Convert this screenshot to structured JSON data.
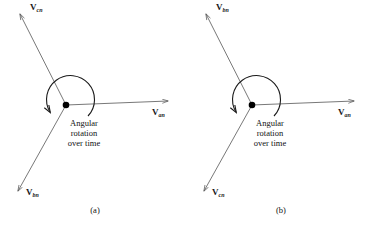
{
  "figure": {
    "type": "phasor-diagram-pair",
    "background_color": "#ffffff",
    "line_color": "#555555",
    "text_color": "#111111",
    "origin_dot_color": "#000000"
  },
  "panels": [
    {
      "id": "a",
      "caption": "(a)",
      "origin": {
        "x": 66,
        "y": 105
      },
      "rotation_note": {
        "line1": "Angular",
        "line2": "rotation",
        "line3": "over time",
        "direction": "counterclockwise"
      },
      "vectors": [
        {
          "name": "vcn",
          "symbol": "V",
          "subscript": "cn",
          "angle_deg": 125,
          "tip": {
            "x": 18,
            "y": 12
          },
          "label_pos": {
            "x": 30,
            "y": 5
          }
        },
        {
          "name": "van",
          "symbol": "V",
          "subscript": "an",
          "angle_deg": 0,
          "tip": {
            "x": 172,
            "y": 101
          },
          "label_pos": {
            "x": 152,
            "y": 110
          }
        },
        {
          "name": "vbn",
          "symbol": "V",
          "subscript": "bn",
          "angle_deg": 235,
          "tip": {
            "x": 14,
            "y": 196
          },
          "label_pos": {
            "x": 26,
            "y": 190
          }
        }
      ]
    },
    {
      "id": "b",
      "caption": "(b)",
      "origin": {
        "x": 66,
        "y": 105
      },
      "rotation_note": {
        "line1": "Angular",
        "line2": "rotation",
        "line3": "over time",
        "direction": "counterclockwise"
      },
      "vectors": [
        {
          "name": "vbn",
          "symbol": "V",
          "subscript": "bn",
          "angle_deg": 125,
          "tip": {
            "x": 18,
            "y": 12
          },
          "label_pos": {
            "x": 30,
            "y": 5
          }
        },
        {
          "name": "van",
          "symbol": "V",
          "subscript": "an",
          "angle_deg": 0,
          "tip": {
            "x": 172,
            "y": 101
          },
          "label_pos": {
            "x": 152,
            "y": 110
          }
        },
        {
          "name": "vcn",
          "symbol": "V",
          "subscript": "cn",
          "angle_deg": 235,
          "tip": {
            "x": 14,
            "y": 196
          },
          "label_pos": {
            "x": 26,
            "y": 190
          }
        }
      ]
    }
  ]
}
